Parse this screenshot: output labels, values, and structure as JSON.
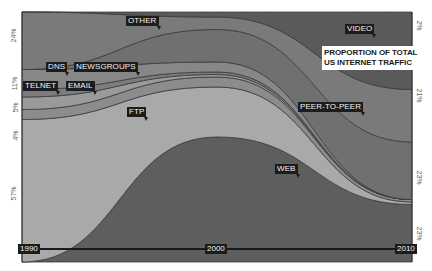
{
  "chart_data": {
    "type": "area",
    "title": "PROPORTION OF TOTAL US INTERNET TRAFFIC",
    "x": [
      1990,
      2000,
      2010
    ],
    "x_tick_labels": [
      "1990",
      "2000",
      "2010"
    ],
    "stack_order_bottom_to_top": [
      "WEB",
      "FTP",
      "EMAIL",
      "TELNET",
      "DNS",
      "NEWSGROUPS",
      "PEER-TO-PEER",
      "OTHER",
      "VIDEO"
    ],
    "series": [
      {
        "name": "WEB",
        "values": [
          0,
          50,
          23
        ]
      },
      {
        "name": "FTP",
        "values": [
          57,
          20,
          1
        ]
      },
      {
        "name": "EMAIL",
        "values": [
          4,
          4,
          1
        ]
      },
      {
        "name": "TELNET",
        "values": [
          5,
          1,
          0
        ]
      },
      {
        "name": "DNS",
        "values": [
          3,
          1,
          0
        ]
      },
      {
        "name": "NEWSGROUPS",
        "values": [
          8,
          4,
          0
        ]
      },
      {
        "name": "PEER-TO-PEER",
        "values": [
          0,
          13,
          23
        ]
      },
      {
        "name": "OTHER",
        "values": [
          23,
          5,
          21
        ]
      },
      {
        "name": "VIDEO",
        "values": [
          0,
          2,
          31
        ]
      }
    ],
    "left_axis_labels": [
      "24%",
      "11%",
      "5%",
      "4%",
      "57%"
    ],
    "right_axis_labels": [
      "2%",
      "21%",
      "23%",
      "23%"
    ],
    "ylim": [
      0,
      100
    ],
    "xlabel": "",
    "ylabel": "",
    "legend": "inline-labels"
  },
  "labels": {
    "other": "OTHER",
    "video": "VIDEO",
    "dns": "DNS",
    "newsgroups": "NEWSGROUPS",
    "telnet": "TELNET",
    "email": "EMAIL",
    "ftp": "FTP",
    "peer": "PEER-TO-PEER",
    "web": "WEB"
  },
  "years": {
    "start": "1990",
    "mid": "2000",
    "end": "2010"
  },
  "title_lines": [
    "PROPORTION OF TOTAL",
    "US INTERNET TRAFFIC"
  ],
  "left_axis": {
    "a": "24%",
    "b": "11%",
    "c": "5%",
    "d": "4%",
    "e": "57%"
  },
  "right_axis": {
    "a": "2%",
    "b": "21%",
    "c": "23%",
    "d": "23%"
  }
}
